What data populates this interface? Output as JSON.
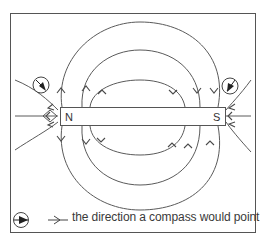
{
  "diagram": {
    "magnet": {
      "north_label": "N",
      "south_label": "S"
    },
    "legend": {
      "text": "the direction a compass would point"
    },
    "colors": {
      "line": "#5a5a5a",
      "frame": "#555555",
      "background": "#ffffff"
    }
  }
}
